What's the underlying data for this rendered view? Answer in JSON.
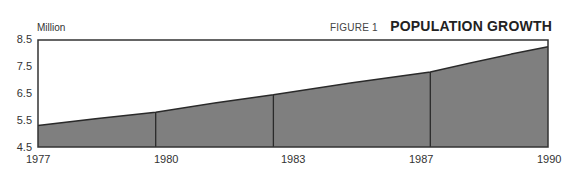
{
  "header": {
    "unit_label": "Million",
    "figure_number": "FIGURE 1",
    "title": "POPULATION GROWTH"
  },
  "colors": {
    "fill": "#7f7f7f",
    "line": "#2a2a2a",
    "frame": "#333333"
  },
  "axis": {
    "y_ticks": [
      "8.5",
      "7.5",
      "6.5",
      "5.5",
      "4.5"
    ],
    "x_ticks": [
      "1977",
      "1980",
      "1983",
      "1987",
      "1990"
    ]
  },
  "chart_data": {
    "type": "area",
    "title": "POPULATION GROWTH",
    "subtitle": "FIGURE 1",
    "xlabel": "",
    "ylabel": "Million",
    "x": [
      1977,
      1980,
      1983,
      1987,
      1990
    ],
    "categories": [
      "1977",
      "1980",
      "1983",
      "1987",
      "1990"
    ],
    "values": [
      5.3,
      5.8,
      6.45,
      7.3,
      8.25
    ],
    "ylim": [
      4.5,
      8.5
    ],
    "yticks": [
      4.5,
      5.5,
      6.5,
      7.5,
      8.5
    ],
    "grid": false,
    "legend": null,
    "annotations": [
      "vertical divider lines drawn at 1980, 1983, 1987"
    ]
  }
}
